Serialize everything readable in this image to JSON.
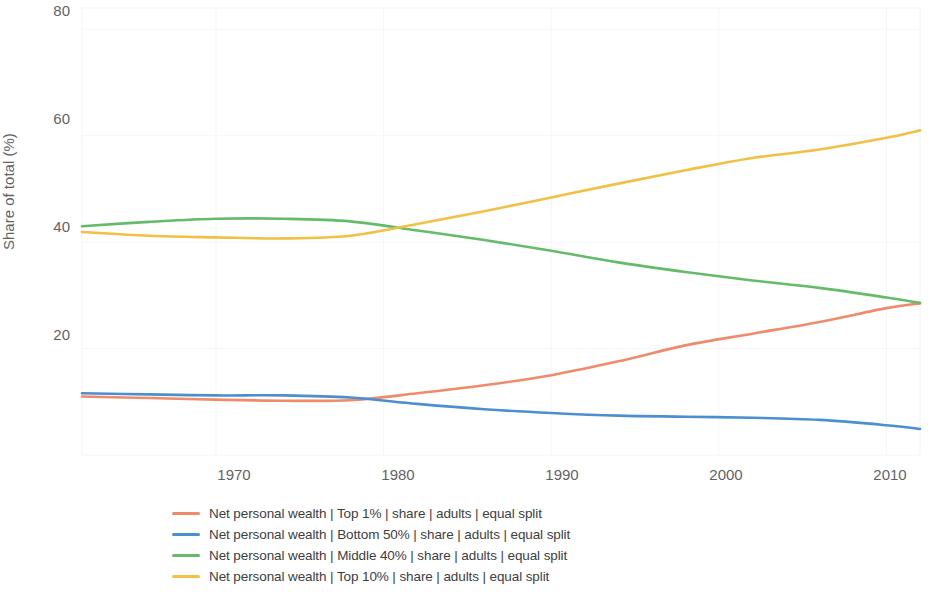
{
  "chart_data": {
    "type": "line",
    "title": "",
    "xlabel": "",
    "ylabel": "Share of total (%)",
    "xlim": [
      1962,
      2012
    ],
    "ylim": [
      0,
      84
    ],
    "grid": true,
    "legend_position": "bottom",
    "y_ticks": [
      20,
      40,
      60,
      80
    ],
    "x_ticks": [
      1970,
      1980,
      1990,
      2000,
      2010
    ],
    "x": [
      1962,
      1966,
      1970,
      1974,
      1978,
      1982,
      1986,
      1990,
      1994,
      1998,
      2002,
      2006,
      2010,
      2012
    ],
    "series": [
      {
        "name": "Net personal wealth | Top 1% | share | adults | equal split",
        "color": "#ef8a6a",
        "values": [
          11.0,
          10.7,
          10.4,
          10.2,
          10.3,
          11.6,
          13.1,
          15.0,
          17.6,
          20.6,
          22.8,
          25.0,
          27.6,
          28.5
        ]
      },
      {
        "name": "Net personal wealth | Bottom 50% | share | adults | equal split",
        "color": "#4b8fd0",
        "values": [
          11.6,
          11.4,
          11.2,
          11.2,
          10.8,
          9.6,
          8.6,
          7.9,
          7.4,
          7.2,
          7.0,
          6.6,
          5.6,
          4.9
        ]
      },
      {
        "name": "Net personal wealth | Middle 40% | share | adults | equal split",
        "color": "#64bb6a",
        "values": [
          43.0,
          43.8,
          44.4,
          44.4,
          43.9,
          42.2,
          40.4,
          38.4,
          36.2,
          34.4,
          32.8,
          31.4,
          29.6,
          28.6
        ]
      },
      {
        "name": "Net personal wealth | Top 10% | share | adults | equal split",
        "color": "#f2c043",
        "values": [
          41.9,
          41.2,
          40.9,
          40.7,
          41.2,
          43.4,
          45.8,
          48.4,
          51.0,
          53.5,
          55.8,
          57.4,
          59.6,
          61.0
        ]
      }
    ]
  },
  "axes": {
    "y_title": "Share of total (%)",
    "y_tick_labels": [
      "80",
      "60",
      "40",
      "20"
    ],
    "x_tick_labels": [
      "1970",
      "1980",
      "1990",
      "2000",
      "2010"
    ]
  },
  "legend": {
    "items": [
      {
        "label": "Net personal wealth | Top 1% | share | adults | equal split",
        "color": "#ef8a6a"
      },
      {
        "label": "Net personal wealth | Bottom 50% | share | adults | equal split",
        "color": "#4b8fd0"
      },
      {
        "label": "Net personal wealth | Middle 40% | share | adults | equal split",
        "color": "#64bb6a"
      },
      {
        "label": "Net personal wealth | Top 10% | share | adults | equal split",
        "color": "#f2c043"
      }
    ]
  }
}
